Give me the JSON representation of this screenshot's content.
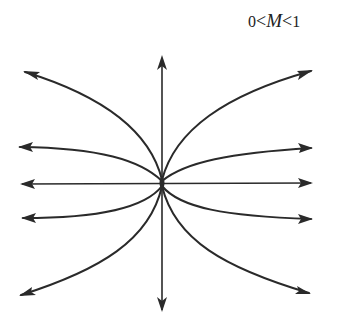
{
  "label": {
    "lower": "0",
    "op1": "<",
    "variable": "M",
    "op2": "<",
    "upper": "1"
  },
  "diagram": {
    "type": "phase-portrait-unstable-node",
    "center": [
      162,
      183
    ],
    "stroke_color": "#2a2a2a",
    "trajectories": [
      {
        "name": "upper-left",
        "end": [
          23,
          71
        ]
      },
      {
        "name": "upper-right",
        "end": [
          313,
          70
        ]
      },
      {
        "name": "mid-upper-left",
        "end": [
          18,
          147
        ]
      },
      {
        "name": "mid-upper-right",
        "end": [
          313,
          148
        ]
      },
      {
        "name": "horizontal-left",
        "end": [
          20,
          184
        ]
      },
      {
        "name": "horizontal-right",
        "end": [
          313,
          183
        ]
      },
      {
        "name": "mid-lower-left",
        "end": [
          21,
          218
        ]
      },
      {
        "name": "mid-lower-right",
        "end": [
          313,
          219
        ]
      },
      {
        "name": "lower-left",
        "end": [
          19,
          296
        ]
      },
      {
        "name": "lower-right",
        "end": [
          311,
          294
        ]
      },
      {
        "name": "vertical-up",
        "end": [
          162,
          55
        ]
      },
      {
        "name": "vertical-down",
        "end": [
          162,
          312
        ]
      }
    ]
  }
}
